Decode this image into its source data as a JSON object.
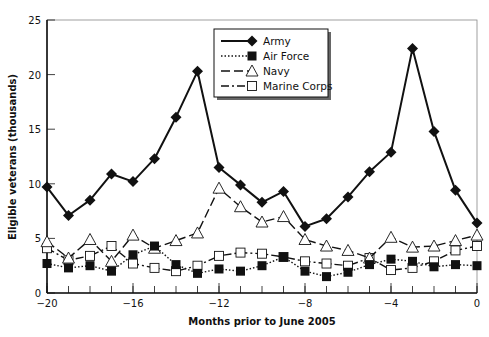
{
  "chart_data": {
    "type": "line",
    "title": "",
    "xlabel": "Months prior to June 2005",
    "ylabel": "Eligible veterans (thousands)",
    "x": [
      -20,
      -19,
      -18,
      -17,
      -16,
      -15,
      -14,
      -13,
      -12,
      -11,
      -10,
      -9,
      -8,
      -7,
      -6,
      -5,
      -4,
      -3,
      -2,
      -1,
      0
    ],
    "xticks": [
      -20,
      -16,
      -12,
      -8,
      -4,
      0
    ],
    "xtick_labels": [
      "−20",
      "−16",
      "−12",
      "−8",
      "−4",
      "0"
    ],
    "yticks": [
      0,
      5,
      10,
      15,
      20,
      25
    ],
    "ytick_labels": [
      "0",
      "5",
      "10",
      "15",
      "20",
      "25"
    ],
    "xlim": [
      -20,
      0
    ],
    "ylim": [
      0,
      25
    ],
    "grid": false,
    "legend_position": "upper center",
    "series": [
      {
        "name": "Army",
        "style": "solid",
        "marker": "diamond-filled",
        "values": [
          9.7,
          7.1,
          8.5,
          10.9,
          10.2,
          12.3,
          16.1,
          20.3,
          11.5,
          9.9,
          8.3,
          9.3,
          6.1,
          6.8,
          8.8,
          11.1,
          12.9,
          22.4,
          14.8,
          9.4,
          6.4
        ]
      },
      {
        "name": "Air Force",
        "style": "dotted",
        "marker": "square-filled",
        "values": [
          2.7,
          2.3,
          2.5,
          2.0,
          3.5,
          4.3,
          2.6,
          1.8,
          2.2,
          2.0,
          2.5,
          3.3,
          2.0,
          1.5,
          1.9,
          2.6,
          3.1,
          2.9,
          2.4,
          2.6,
          2.5
        ]
      },
      {
        "name": "Navy",
        "style": "dashed",
        "marker": "triangle-open",
        "values": [
          4.7,
          3.2,
          4.9,
          2.9,
          5.3,
          4.1,
          4.8,
          5.5,
          9.6,
          7.9,
          6.5,
          7.0,
          4.9,
          4.3,
          3.9,
          3.2,
          5.1,
          4.2,
          4.3,
          4.8,
          5.3
        ]
      },
      {
        "name": "Marine Corps",
        "style": "dash-dot",
        "marker": "square-open",
        "values": [
          4.1,
          3.0,
          3.4,
          4.3,
          2.7,
          2.3,
          2.0,
          2.5,
          3.4,
          3.7,
          3.6,
          3.3,
          2.9,
          2.7,
          2.5,
          3.2,
          2.1,
          2.3,
          2.9,
          3.9,
          4.3
        ]
      }
    ]
  }
}
